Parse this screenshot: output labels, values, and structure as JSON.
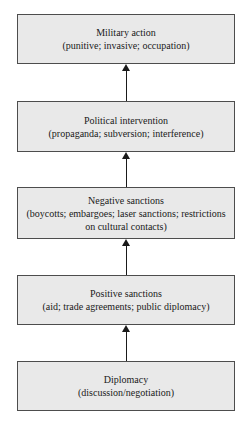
{
  "diagram": {
    "type": "vertical-flow-escalation-ladder",
    "boxes": [
      {
        "title": "Diplomacy",
        "subtitle": "(discussion/negotiation)"
      },
      {
        "title": "Positive sanctions",
        "subtitle": "(aid; trade agreements; public diplomacy)"
      },
      {
        "title": "Negative sanctions",
        "subtitle": "(boycotts; embargoes; laser sanctions; restrictions on cultural contacts)"
      },
      {
        "title": "Political intervention",
        "subtitle": "(propaganda; subversion; interference)"
      },
      {
        "title": "Military action",
        "subtitle": "(punitive; invasive; occupation)"
      }
    ],
    "arrows": {
      "direction": "up",
      "count": 4
    },
    "colors": {
      "box_fill": "#e9e9e9",
      "box_border": "#4d4d4d",
      "arrow": "#1a1a1a",
      "background": "#ffffff",
      "text": "#1a1a1a"
    }
  }
}
